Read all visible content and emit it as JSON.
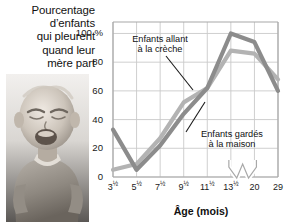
{
  "figure": {
    "title_lines": [
      "Pourcentage",
      "d’enfants",
      "qui pleurent",
      "quand leur",
      "mère part"
    ],
    "photo_caption": "crying-baby-photograph"
  },
  "chart_data": {
    "type": "line",
    "title": "Pourcentage d’enfants qui pleurent quand leur mère part",
    "xlabel": "Âge (mois)",
    "ylabel": "100 %",
    "categories": [
      "3½",
      "5½",
      "7½",
      "9½",
      "11½",
      "13½",
      "20",
      "29"
    ],
    "x_tick_labels": [
      "3½",
      "5½",
      "7½",
      "9½",
      "11½",
      "13½",
      "20",
      "29"
    ],
    "y_tick_labels": [
      "0",
      "20",
      "40",
      "60",
      "80",
      "100 %"
    ],
    "y_ticks": [
      0,
      20,
      40,
      60,
      80,
      100
    ],
    "ylim": [
      0,
      108
    ],
    "grid": true,
    "legend": "annotations",
    "axis_break": true,
    "axis_break_between": [
      "13½",
      "20"
    ],
    "series": [
      {
        "name": "Enfants allant à la crèche",
        "color": "#8c8c8c",
        "values": [
          33,
          5,
          22,
          44,
          62,
          100,
          94,
          60
        ]
      },
      {
        "name": "Enfants gardés à la maison",
        "color": "#b3b3b3",
        "values": [
          5,
          9,
          27,
          52,
          62,
          88,
          86,
          68
        ]
      }
    ],
    "annotations": [
      {
        "name": "creche-annotation",
        "lines": [
          "Enfants allant",
          "à la crèche"
        ]
      },
      {
        "name": "maison-annotation",
        "lines": [
          "Enfants gardés",
          "à la maison"
        ]
      }
    ]
  },
  "colors": {
    "grid": "#c9c9c9",
    "frame": "#a8a8a8",
    "series_dark": "#8c8c8c",
    "series_light": "#b8b8b8",
    "text": "#111111"
  }
}
